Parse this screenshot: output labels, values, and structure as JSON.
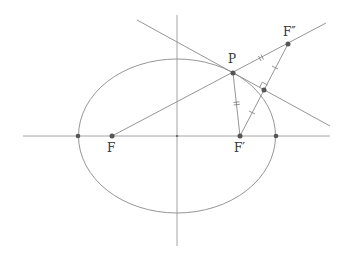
{
  "diagram": {
    "colors": {
      "line": "#8a8a8a",
      "axis": "#9a9a9a",
      "point": "#555555",
      "label": "#333333"
    },
    "points": {
      "F": {
        "label": "F",
        "x": 112,
        "y": 136
      },
      "F_prime": {
        "label": "F′",
        "x": 240,
        "y": 136
      },
      "F_double_prime": {
        "label": "F″",
        "x": 288,
        "y": 44
      },
      "P": {
        "label": "P",
        "x": 233,
        "y": 73
      },
      "M": {
        "label": "",
        "x": 264,
        "y": 90
      },
      "left_vertex": {
        "label": "",
        "x": 78,
        "y": 136
      },
      "right_vertex": {
        "label": "",
        "x": 276,
        "y": 136
      }
    },
    "ellipse": {
      "cx": 177,
      "cy": 136,
      "rx": 98.5,
      "ry": 77
    },
    "axes": {
      "horizontal": {
        "x1": 23,
        "y1": 136,
        "x2": 330,
        "y2": 136
      },
      "vertical": {
        "x1": 177,
        "y1": 15,
        "x2": 177,
        "y2": 246
      }
    },
    "lines": {
      "tangent": {
        "x1": 137,
        "y1": 20,
        "x2": 330,
        "y2": 126
      },
      "F_to_F_double_prime": {
        "x1": 112,
        "y1": 136,
        "x2": 326,
        "y2": 23
      },
      "P_to_F_prime": {
        "x1": 233,
        "y1": 73,
        "x2": 240,
        "y2": 136
      },
      "F_prime_to_F_double_prime": {
        "x1": 240,
        "y1": 136,
        "x2": 288,
        "y2": 44
      }
    }
  }
}
